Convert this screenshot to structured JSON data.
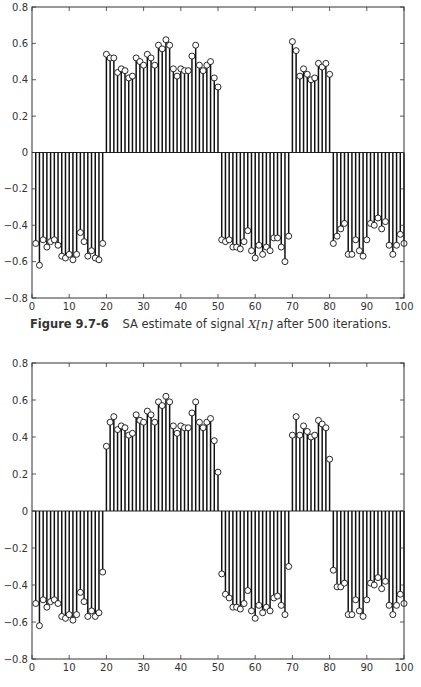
{
  "caption": {
    "figure_number": "Figure 9.7-6",
    "text_before": "SA estimate of signal",
    "math": "X[n]",
    "text_after": "after 500 iterations."
  },
  "chart_data": [
    {
      "type": "stem",
      "title": "",
      "xlabel": "",
      "ylabel": "",
      "xlim": [
        0,
        100
      ],
      "ylim": [
        -0.8,
        0.8
      ],
      "xticks": [
        0,
        10,
        20,
        30,
        40,
        50,
        60,
        70,
        80,
        90,
        100
      ],
      "yticks": [
        -0.8,
        -0.6,
        -0.4,
        -0.2,
        0,
        0.2,
        0.4,
        0.6,
        0.8
      ],
      "ytick_labels": [
        "-0.8",
        "-0.6",
        "-0.4",
        "-0.2",
        "0",
        "0.2",
        "0.4",
        "0.6",
        "0.8"
      ],
      "grid": false,
      "marker": "circle",
      "x_start": 1,
      "values": [
        -0.5,
        -0.62,
        -0.48,
        -0.52,
        -0.49,
        -0.48,
        -0.51,
        -0.57,
        -0.58,
        -0.56,
        -0.59,
        -0.56,
        -0.44,
        -0.49,
        -0.57,
        -0.54,
        -0.58,
        -0.59,
        -0.5,
        0.54,
        0.52,
        0.52,
        0.44,
        0.46,
        0.45,
        0.41,
        0.42,
        0.52,
        0.5,
        0.48,
        0.54,
        0.52,
        0.48,
        0.59,
        0.57,
        0.62,
        0.59,
        0.46,
        0.42,
        0.46,
        0.45,
        0.45,
        0.53,
        0.59,
        0.48,
        0.45,
        0.48,
        0.5,
        0.41,
        0.36,
        -0.48,
        -0.49,
        -0.48,
        -0.52,
        -0.52,
        -0.53,
        -0.49,
        -0.43,
        -0.54,
        -0.58,
        -0.51,
        -0.56,
        -0.52,
        -0.54,
        -0.47,
        -0.47,
        -0.52,
        -0.6,
        -0.46,
        0.61,
        0.56,
        0.42,
        0.46,
        0.43,
        0.4,
        0.41,
        0.49,
        0.47,
        0.49,
        0.43,
        -0.5,
        -0.46,
        -0.42,
        -0.39,
        -0.56,
        -0.56,
        -0.48,
        -0.54,
        -0.57,
        -0.48,
        -0.39,
        -0.4,
        -0.36,
        -0.42,
        -0.38,
        -0.51,
        -0.56,
        -0.51,
        -0.45,
        -0.5
      ]
    },
    {
      "type": "stem",
      "title": "",
      "xlabel": "",
      "ylabel": "",
      "xlim": [
        0,
        100
      ],
      "ylim": [
        -0.8,
        0.8
      ],
      "xticks": [
        0,
        10,
        20,
        30,
        40,
        50,
        60,
        70,
        80,
        90,
        100
      ],
      "yticks": [
        -0.8,
        -0.6,
        -0.4,
        -0.2,
        0,
        0.2,
        0.4,
        0.6,
        0.8
      ],
      "ytick_labels": [
        "-0.8",
        "-0.6",
        "-0.4",
        "-0.2",
        "0",
        "0.2",
        "0.4",
        "0.6",
        "0.8"
      ],
      "grid": false,
      "marker": "circle",
      "x_start": 1,
      "values": [
        -0.5,
        -0.62,
        -0.48,
        -0.52,
        -0.49,
        -0.48,
        -0.5,
        -0.57,
        -0.58,
        -0.56,
        -0.59,
        -0.56,
        -0.44,
        -0.49,
        -0.57,
        -0.54,
        -0.57,
        -0.55,
        -0.33,
        0.35,
        0.48,
        0.51,
        0.44,
        0.46,
        0.45,
        0.41,
        0.42,
        0.52,
        0.49,
        0.48,
        0.54,
        0.52,
        0.48,
        0.59,
        0.57,
        0.62,
        0.59,
        0.46,
        0.42,
        0.46,
        0.45,
        0.45,
        0.53,
        0.59,
        0.48,
        0.45,
        0.48,
        0.5,
        0.38,
        0.21,
        -0.34,
        -0.45,
        -0.47,
        -0.52,
        -0.52,
        -0.53,
        -0.5,
        -0.43,
        -0.54,
        -0.58,
        -0.51,
        -0.55,
        -0.52,
        -0.54,
        -0.47,
        -0.46,
        -0.51,
        -0.56,
        -0.3,
        0.41,
        0.51,
        0.41,
        0.46,
        0.43,
        0.4,
        0.41,
        0.49,
        0.47,
        0.45,
        0.28,
        -0.32,
        -0.41,
        -0.41,
        -0.39,
        -0.56,
        -0.56,
        -0.48,
        -0.54,
        -0.57,
        -0.48,
        -0.39,
        -0.4,
        -0.36,
        -0.42,
        -0.38,
        -0.51,
        -0.56,
        -0.51,
        -0.45,
        -0.5
      ]
    }
  ]
}
